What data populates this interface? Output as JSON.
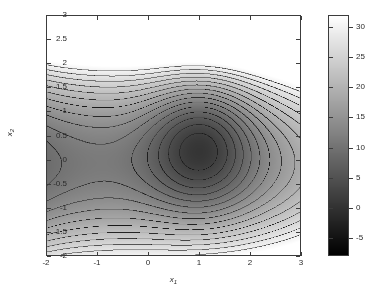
{
  "figure": {
    "background": "#ffffff",
    "axes_color": "#3c3c3c",
    "text_color": "#2a2a2a"
  },
  "chart_data": {
    "type": "heatmap",
    "subtype": "filled-contour",
    "title": "",
    "xlabel": "x1",
    "ylabel": "x2",
    "xlim": [
      -2,
      3
    ],
    "ylim": [
      -2,
      3
    ],
    "xticks": [
      -2,
      -1,
      0,
      1,
      2,
      3
    ],
    "xticklabels": [
      "-2",
      "-1",
      "0",
      "1",
      "2",
      "3"
    ],
    "yticks": [
      -2,
      -1.5,
      -1,
      -0.5,
      0,
      0.5,
      1,
      1.5,
      2,
      2.5,
      3
    ],
    "yticklabels": [
      "-2",
      "-1.5",
      "-1",
      "-0.5",
      "0",
      "0.5",
      "1",
      "1.5",
      "2",
      "2.5",
      "3"
    ],
    "grid": false,
    "colormap": "gray",
    "clim": [
      -8,
      32
    ],
    "colorbar": {
      "position": "right",
      "ticks": [
        -5,
        0,
        5,
        10,
        15,
        20,
        25,
        30
      ],
      "ticklabels": [
        "-5",
        "0",
        "5",
        "10",
        "15",
        "20",
        "25",
        "30"
      ],
      "low_color": "#000000",
      "high_color": "#ffffff"
    },
    "contour_levels": [
      -6,
      -4,
      -2,
      0,
      2,
      4,
      6,
      8,
      10,
      12,
      14,
      16,
      18,
      20,
      22,
      24,
      26,
      28,
      30
    ],
    "contour_line_color": "#1a1a1a",
    "features": [
      {
        "kind": "saddle-point",
        "x": -1.0,
        "y": 0.05,
        "value": 4.0
      },
      {
        "kind": "local-minimum",
        "x": 1.05,
        "y": 0.35,
        "value": -7.5
      }
    ],
    "surface_model": {
      "description": "smooth two-variable scalar field with one saddle near (-1,0) and one basin minimum near (1,0.35); values rise steeply toward the right edge (x1=3) and toward the top-left and bottom-left corners",
      "value_at_corners": {
        "x_-2_y_3": 22,
        "x_3_y_3": 31,
        "x_-2_y_-2": 20,
        "x_3_y_-2": 30
      }
    }
  },
  "axis_titles": {
    "x_main": "x",
    "x_sub": "1",
    "y_main": "x",
    "y_sub": "2"
  }
}
